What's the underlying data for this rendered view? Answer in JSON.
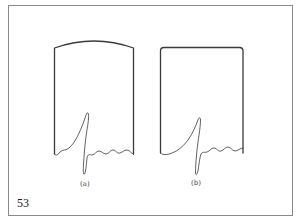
{
  "figure": {
    "number": "53",
    "frame_color": "#8a8a8a",
    "line_color": "#3a3a3a",
    "panels": [
      {
        "id": "a",
        "label": "(a)",
        "top_shape": "convex arc",
        "waveform": "tall narrow spike rising from baseline then deep sharp trough followed by small ripples"
      },
      {
        "id": "b",
        "label": "(b)",
        "top_shape": "flat with rounded corners",
        "waveform": "gradual upslope to spike then sharp trough followed by small ripples"
      }
    ]
  }
}
